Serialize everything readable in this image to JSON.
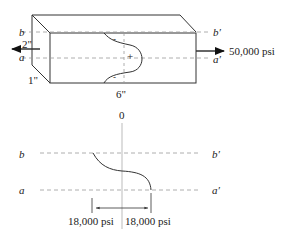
{
  "top": {
    "labels": {
      "b": "b",
      "a": "a",
      "b_prime": "b′",
      "a_prime": "a′",
      "height": "2\"",
      "depth": "1\"",
      "length": "6\"",
      "load": "50,000 psi"
    },
    "signs": {
      "top": "-",
      "middle": "+",
      "bottom": "-"
    }
  },
  "bottom": {
    "labels": {
      "zero": "0",
      "b": "b",
      "a": "a",
      "b_prime": "b′",
      "a_prime": "a′",
      "left_stress": "18,000 psi",
      "right_stress": "18,000 psi"
    }
  },
  "colors": {
    "line": "#333333",
    "dash": "#999999",
    "axis": "#aaaaaa"
  }
}
